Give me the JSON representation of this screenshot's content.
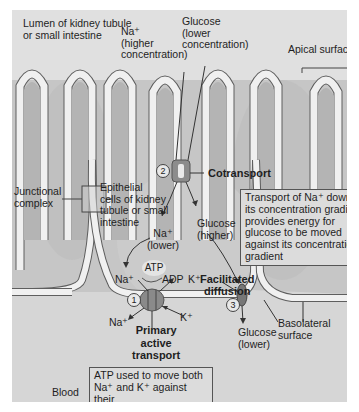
{
  "figure": {
    "labels": {
      "lumen": "Lumen of kidney tubule",
      "lumen_2": "or small intestine",
      "na_top": "Na⁺",
      "na_top_2": "(higher",
      "na_top_3": "concentration)",
      "glucose_top": "Glucose",
      "glucose_top_2": "(lower",
      "glucose_top_3": "concentration)",
      "apical": "Apical surface",
      "junctional": "Junctional",
      "junctional_2": "complex",
      "epithelial": "Epithelial",
      "epithelial_2": "cells of kidney",
      "epithelial_3": "tubule or small",
      "epithelial_4": "intestine",
      "cotransport": "Cotransport",
      "na_lower": "Na⁺",
      "na_lower_2": "(lower)",
      "glucose_higher": "Glucose",
      "glucose_higher_2": "(higher)",
      "atp": "ATP",
      "adp": "ADP",
      "na_in": "Na⁺",
      "k_in": "K⁺",
      "facilitated": "Facilitated",
      "facilitated_2": "diffusion",
      "na_out": "Na⁺",
      "k_out": "K⁺",
      "primary": "Primary",
      "primary_2": "active",
      "primary_3": "transport",
      "glucose_lower": "Glucose",
      "glucose_lower_2": "(lower)",
      "basolateral": "Basolateral",
      "basolateral_2": "surface",
      "blood": "Blood"
    },
    "steps": [
      "1",
      "2",
      "3"
    ],
    "boxes": {
      "cotransport_note": [
        "Transport of Na⁺ down",
        "its concentration gradient",
        "provides energy for",
        "glucose to be moved",
        "against its concentration",
        "gradient"
      ],
      "atp_note": [
        "ATP used to move both",
        "Na⁺ and K⁺ against their",
        "concentration gradients"
      ]
    },
    "colors": {
      "background": "#d9d9d9",
      "lumen": "#e2e2e2",
      "cell": "#c4c4c4",
      "membrane": "#f2f2f2",
      "membrane_edge": "#6a6a6a",
      "transporter": "#8a8a8a"
    }
  }
}
